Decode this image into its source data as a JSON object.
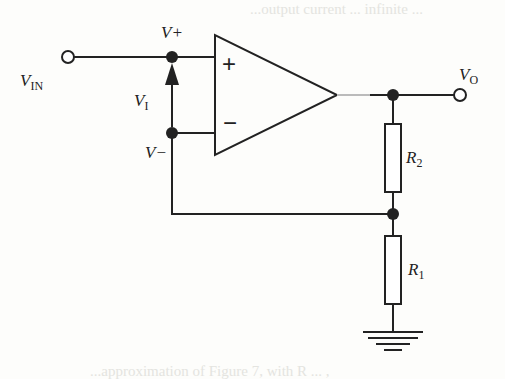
{
  "diagram": {
    "type": "circuit-schematic",
    "labels": {
      "vin": {
        "main": "V",
        "sub": "IN"
      },
      "vplus": "V+",
      "vminus": "V−",
      "vi": {
        "main": "V",
        "sub": "I"
      },
      "vo": {
        "main": "V",
        "sub": "O"
      },
      "r2": {
        "main": "R",
        "sub": "2"
      },
      "r1": {
        "main": "R",
        "sub": "1"
      },
      "plus_input": "+",
      "minus_input": "−"
    },
    "components": [
      {
        "id": "opamp",
        "kind": "operational-amplifier"
      },
      {
        "id": "R2",
        "kind": "resistor",
        "between": [
          "VO node",
          "feedback node"
        ]
      },
      {
        "id": "R1",
        "kind": "resistor",
        "between": [
          "feedback node",
          "ground"
        ]
      },
      {
        "id": "ground",
        "kind": "ground-symbol"
      }
    ],
    "colors": {
      "line": "#222222",
      "background": "#fdfdfb"
    },
    "ghost_text": {
      "top": "...output current ... infinite ...",
      "bottom": "...approximation of Figure 7, with R ... ,"
    }
  }
}
